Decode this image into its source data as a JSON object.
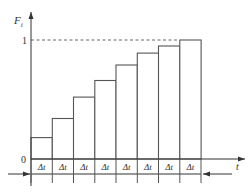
{
  "labels": {
    "y_axis": "F",
    "y_axis_sub": "i",
    "x_axis": "t",
    "y_one": "1",
    "y_zero": "0",
    "interval": "Δt"
  },
  "chart_data": {
    "type": "bar",
    "title": "",
    "xlabel": "t",
    "ylabel": "F_i",
    "categories": [
      "Δt",
      "Δt",
      "Δt",
      "Δt",
      "Δt",
      "Δt",
      "Δt",
      "Δt"
    ],
    "values": [
      0.18,
      0.34,
      0.52,
      0.66,
      0.79,
      0.89,
      0.95,
      1.0
    ],
    "ylim": [
      0,
      1
    ],
    "y_ticks": [
      "0",
      "1"
    ],
    "annotations": [
      "dashed reference line at F_i = 1",
      "each column width Δt",
      "double-headed interval arrows below axis"
    ],
    "grid": false,
    "legend": null
  },
  "colors": {
    "line": "#333333",
    "bar_edge": "#555555",
    "background": "#ffffff"
  }
}
